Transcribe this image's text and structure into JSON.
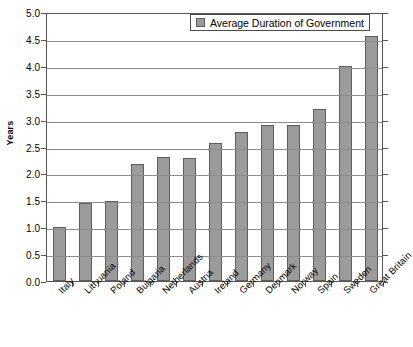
{
  "chart_data": {
    "type": "bar",
    "title": "",
    "xlabel": "",
    "ylabel": "Years",
    "ylim": [
      0.0,
      5.0
    ],
    "ytick_step": 0.5,
    "grid": true,
    "legend_position": "top-right-inside",
    "legend": [
      "Average Duration of Government"
    ],
    "categories": [
      "Italy",
      "Lithuania",
      "Poland",
      "Bulgaria",
      "Netherlands",
      "Austria",
      "Ireland",
      "Germany",
      "Denmark",
      "Norway",
      "Spain",
      "Sweden",
      "Great Britain"
    ],
    "values": [
      1.0,
      1.45,
      1.48,
      2.18,
      2.3,
      2.28,
      2.57,
      2.77,
      2.9,
      2.9,
      3.2,
      4.0,
      4.55
    ],
    "ytick_labels": [
      "0.0",
      "0.5",
      "1.0",
      "1.5",
      "2.0",
      "2.5",
      "3.0",
      "3.5",
      "4.0",
      "4.5",
      "5.0"
    ],
    "series_name": "Average Duration of Government",
    "colors": {
      "bar_fill": "#9b9b9b",
      "bar_border": "#5e5e5e",
      "gridline": "#8c8c8c",
      "axis": "#555555",
      "text": "#000000",
      "background": "#ffffff"
    }
  },
  "legend": {
    "entry_label": "Average Duration of Government"
  },
  "axes": {
    "y_title": "Years"
  }
}
